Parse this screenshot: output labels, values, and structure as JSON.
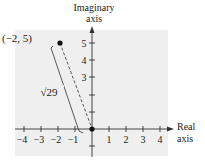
{
  "diagram": {
    "type": "complex-plane",
    "y_axis_label_line1": "Imaginary",
    "y_axis_label_line2": "axis",
    "x_axis_label_line1": "Real",
    "x_axis_label_line2": "axis",
    "point_label": "(−2, 5)",
    "distance_label": "√29",
    "x_ticks": [
      "−4",
      "−3",
      "−2",
      "−1",
      "1",
      "2",
      "3",
      "4"
    ],
    "y_ticks": [
      "5",
      "4",
      "3"
    ],
    "point": {
      "x": -2,
      "y": 5
    },
    "origin": {
      "x": 0,
      "y": 0
    },
    "colors": {
      "background_panel": "#efefef",
      "axis": "#333333",
      "ink": "#222222"
    }
  }
}
